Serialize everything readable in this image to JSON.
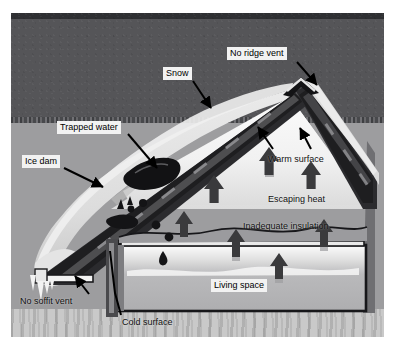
{
  "figure": {
    "background_color": "#ffffff",
    "frame": {
      "x": 11,
      "y": 13,
      "width": 373,
      "height": 324
    }
  },
  "palette": {
    "sky": "#555558",
    "sky_top_band": "#2f3033",
    "ground_mid": "#9d9d9f",
    "ground_low": "#c9c9c9",
    "snow": "#e9e9e9",
    "snow_shadow": "#cfcfcf",
    "roof_dark": "#1e1e20",
    "roof_mid": "#6d6d70",
    "attic_light": "#f4f4f4",
    "living_space": "#b4b4b6",
    "arrow_dark": "#3a3a3c",
    "arrow_trail": "#8d8d90",
    "label_box": "#f2f2f2",
    "label_text": "#000000",
    "leader_line": "#000000"
  },
  "labels": [
    {
      "id": "no-ridge-vent",
      "text": "No ridge vent",
      "x": 216,
      "y": 34,
      "style": "boxed"
    },
    {
      "id": "snow",
      "text": "Snow",
      "x": 152,
      "y": 54,
      "style": "boxed"
    },
    {
      "id": "trapped-water",
      "text": "Trapped water",
      "x": 46,
      "y": 108,
      "style": "boxed"
    },
    {
      "id": "ice-dam",
      "text": "Ice dam",
      "x": 11,
      "y": 142,
      "style": "boxed"
    },
    {
      "id": "warm-surface",
      "text": "Warm surface",
      "x": 257,
      "y": 141,
      "style": "plain"
    },
    {
      "id": "escaping-heat",
      "text": "Escaping heat",
      "x": 257,
      "y": 181,
      "style": "plain"
    },
    {
      "id": "inadequate-insulation",
      "text": "Inadequate insulation",
      "x": 232,
      "y": 208,
      "style": "plain"
    },
    {
      "id": "living-space",
      "text": "Living space",
      "x": 200,
      "y": 266,
      "style": "boxed"
    },
    {
      "id": "no-soffit-vent",
      "text": "No soffit vent",
      "x": 9,
      "y": 283,
      "style": "plain"
    },
    {
      "id": "cold-surface",
      "text": "Cold surface",
      "x": 111,
      "y": 304,
      "style": "plain"
    }
  ],
  "leaders": [
    {
      "id": "leader-no-ridge-vent",
      "from_label": "no-ridge-vent",
      "path": "M 286 49 L 306 72",
      "arrow": true
    },
    {
      "id": "leader-snow",
      "from_label": "snow",
      "path": "M 182 68 L 200 95",
      "arrow": true
    },
    {
      "id": "leader-trapped-water",
      "from_label": "trapped-water",
      "path": "M 117 121 L 146 155",
      "arrow": true
    },
    {
      "id": "leader-ice-dam",
      "from_label": "ice-dam",
      "path": "M 53 155 L 92 174",
      "arrow": true
    },
    {
      "id": "leader-warm-surface-l",
      "from_label": "warm-surface",
      "path": "M 262 136 L 247 115",
      "arrow": true
    },
    {
      "id": "leader-warm-surface-r",
      "from_label": "warm-surface",
      "path": "M 298 136 L 288 116",
      "arrow": true
    },
    {
      "id": "leader-no-soffit-vent",
      "from_label": "no-soffit-vent",
      "path": "M 78 281 L 64 264",
      "arrow": true
    },
    {
      "id": "leader-cold-surface",
      "from_label": "cold-surface",
      "path": "M 110 303 L 100 237",
      "arrow": false
    }
  ],
  "scene_elements": [
    {
      "id": "sky",
      "name": "night-sky",
      "description": "dark grey sky behind house"
    },
    {
      "id": "snow-blanket",
      "name": "snow-layer",
      "description": "white snow blanket over left roof slope"
    },
    {
      "id": "roof-left",
      "name": "left-roof-slope",
      "description": "dark sloping roof deck with rafters"
    },
    {
      "id": "roof-right",
      "name": "right-roof-slope",
      "description": "dark roof deck on right side of ridge"
    },
    {
      "id": "ridge",
      "name": "roof-ridge",
      "description": "roof peak with no ridge vent"
    },
    {
      "id": "ice-dam-mass",
      "name": "ice-dam-mass",
      "description": "ice build-up at eave edge"
    },
    {
      "id": "trapped-water-pool",
      "name": "trapped-water-pool",
      "description": "dark pool of water backed up behind ice dam"
    },
    {
      "id": "icicles",
      "name": "icicles",
      "description": "icicles hanging at the eave"
    },
    {
      "id": "attic",
      "name": "attic-space",
      "description": "bright attic cavity under roof"
    },
    {
      "id": "insulation",
      "name": "attic-insulation",
      "description": "thin uneven insulation layer on attic floor"
    },
    {
      "id": "living-space-room",
      "name": "living-space-room",
      "description": "heated room below the insulated ceiling"
    },
    {
      "id": "water-drop",
      "name": "water-drip",
      "description": "water droplet leaking into living space"
    }
  ],
  "heat_arrows": [
    {
      "id": "arrow-1",
      "x": 203,
      "y": 167,
      "size": 13,
      "region": "attic"
    },
    {
      "id": "arrow-2",
      "x": 258,
      "y": 139,
      "size": 13,
      "region": "attic"
    },
    {
      "id": "arrow-3",
      "x": 300,
      "y": 153,
      "size": 13,
      "region": "attic"
    },
    {
      "id": "arrow-4",
      "x": 173,
      "y": 203,
      "size": 12,
      "region": "ceiling"
    },
    {
      "id": "arrow-5",
      "x": 225,
      "y": 222,
      "size": 12,
      "region": "ceiling"
    },
    {
      "id": "arrow-6",
      "x": 313,
      "y": 212,
      "size": 12,
      "region": "ceiling"
    },
    {
      "id": "arrow-7",
      "x": 268,
      "y": 245,
      "size": 12,
      "region": "living-space"
    }
  ]
}
